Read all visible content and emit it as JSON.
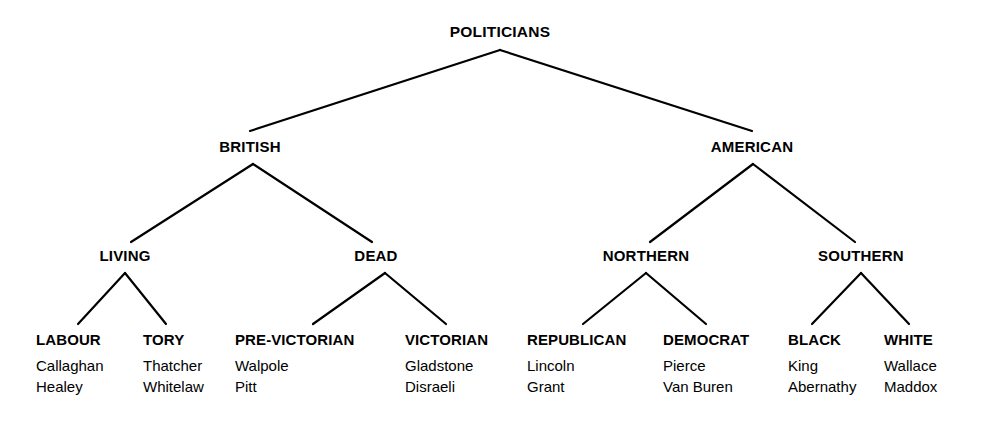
{
  "diagram": {
    "title": "POLITICIANS",
    "type": "hierarchical-tree",
    "levels": 4,
    "colors": {
      "background": "#ffffff",
      "text": "#000000",
      "edge": "#000000"
    },
    "root": {
      "label": "POLITICIANS",
      "x": 500,
      "y": 32
    },
    "level2": [
      {
        "label": "BRITISH",
        "x": 250,
        "y": 146
      },
      {
        "label": "AMERICAN",
        "x": 752,
        "y": 146
      }
    ],
    "level3": [
      {
        "label": "LIVING",
        "x": 125,
        "y": 255
      },
      {
        "label": "DEAD",
        "x": 376,
        "y": 255
      },
      {
        "label": "NORTHERN",
        "x": 646,
        "y": 255
      },
      {
        "label": "SOUTHERN",
        "x": 861,
        "y": 255
      }
    ],
    "leaves": [
      {
        "title": "LABOUR",
        "x": 36,
        "y": 332,
        "members": [
          "Callaghan",
          "Healey"
        ]
      },
      {
        "title": "TORY",
        "x": 143,
        "y": 332,
        "members": [
          "Thatcher",
          "Whitelaw"
        ]
      },
      {
        "title": "PRE-VICTORIAN",
        "x": 235,
        "y": 332,
        "members": [
          "Walpole",
          "Pitt"
        ]
      },
      {
        "title": "VICTORIAN",
        "x": 405,
        "y": 332,
        "members": [
          "Gladstone",
          "Disraeli"
        ]
      },
      {
        "title": "REPUBLICAN",
        "x": 527,
        "y": 332,
        "members": [
          "Lincoln",
          "Grant"
        ]
      },
      {
        "title": "DEMOCRAT",
        "x": 663,
        "y": 332,
        "members": [
          "Pierce",
          "Van Buren"
        ]
      },
      {
        "title": "BLACK",
        "x": 788,
        "y": 332,
        "members": [
          "King",
          "Abernathy"
        ]
      },
      {
        "title": "WHITE",
        "x": 884,
        "y": 332,
        "members": [
          "Wallace",
          "Maddox"
        ]
      }
    ],
    "edges": [
      {
        "from": "POLITICIANS",
        "to": "BRITISH",
        "x1": 500,
        "y1": 50,
        "x2": 250,
        "y2": 131
      },
      {
        "from": "POLITICIANS",
        "to": "AMERICAN",
        "x1": 500,
        "y1": 50,
        "x2": 752,
        "y2": 131
      },
      {
        "from": "BRITISH",
        "to": "LIVING",
        "x1": 253,
        "y1": 164,
        "x2": 131,
        "y2": 242
      },
      {
        "from": "BRITISH",
        "to": "DEAD",
        "x1": 253,
        "y1": 164,
        "x2": 372,
        "y2": 242
      },
      {
        "from": "AMERICAN",
        "to": "NORTHERN",
        "x1": 753,
        "y1": 164,
        "x2": 650,
        "y2": 242
      },
      {
        "from": "AMERICAN",
        "to": "SOUTHERN",
        "x1": 753,
        "y1": 164,
        "x2": 855,
        "y2": 242
      },
      {
        "from": "LIVING",
        "to": "LABOUR",
        "x1": 125,
        "y1": 273,
        "x2": 78,
        "y2": 324
      },
      {
        "from": "LIVING",
        "to": "TORY",
        "x1": 125,
        "y1": 273,
        "x2": 166,
        "y2": 324
      },
      {
        "from": "DEAD",
        "to": "PRE-VICTORIAN",
        "x1": 385,
        "y1": 273,
        "x2": 313,
        "y2": 324
      },
      {
        "from": "DEAD",
        "to": "VICTORIAN",
        "x1": 385,
        "y1": 273,
        "x2": 446,
        "y2": 324
      },
      {
        "from": "NORTHERN",
        "to": "REPUBLICAN",
        "x1": 646,
        "y1": 273,
        "x2": 583,
        "y2": 324
      },
      {
        "from": "NORTHERN",
        "to": "DEMOCRAT",
        "x1": 646,
        "y1": 273,
        "x2": 706,
        "y2": 324
      },
      {
        "from": "SOUTHERN",
        "to": "BLACK",
        "x1": 861,
        "y1": 273,
        "x2": 812,
        "y2": 324
      },
      {
        "from": "SOUTHERN",
        "to": "WHITE",
        "x1": 861,
        "y1": 273,
        "x2": 909,
        "y2": 324
      }
    ]
  }
}
